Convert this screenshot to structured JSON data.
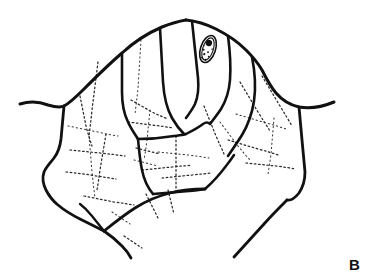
{
  "figure": {
    "panel_label": "B",
    "caption_text": "",
    "background_color": "#ffffff",
    "ink_color": "#111111",
    "width_px": 369,
    "height_px": 278,
    "medium": "black-and-white line drawing"
  },
  "artwork": {
    "spiracle": {
      "label": "spiracle",
      "center_x": 208,
      "center_y": 49,
      "rx": 7.5,
      "ry": 14,
      "rotation_deg": 18,
      "dark_dot": {
        "cx": 207,
        "cy": 43,
        "r": 3.2
      },
      "speckles": [
        [
          204,
          51,
          1.0
        ],
        [
          209,
          52,
          0.9
        ],
        [
          206,
          55,
          1.1
        ],
        [
          211,
          56,
          0.8
        ],
        [
          205,
          59,
          0.9
        ],
        [
          209,
          60,
          1.0
        ],
        [
          203,
          47,
          0.7
        ],
        [
          212,
          48,
          0.7
        ]
      ]
    },
    "outline_paths": [
      {
        "name": "upper-left-margin",
        "width": 3.0,
        "d": "M 20 104 C 30 101 40 102 48 105 C 55 107 60 108 64 106 C 70 103 76 97 84 89 C 95 78 108 65 122 53 C 134 42 148 33 162 27 C 172 23 180 21 186 20"
      },
      {
        "name": "upper-right-margin",
        "width": 3.0,
        "d": "M 186 20 C 196 21 206 24 216 29 C 228 35 238 42 246 50 C 252 56 258 63 262 70 C 266 78 270 86 276 93 C 282 100 290 105 299 107 C 310 109 322 107 334 102"
      },
      {
        "name": "left-lateral-margin",
        "width": 2.8,
        "d": "M 64 106 C 63 117 62 128 61 139 C 60 147 58 153 54 158 C 50 163 46 167 44 172 C 42 178 43 184 46 190 C 49 196 53 201 58 205 C 64 210 72 215 80 219 C 88 223 96 227 104 231"
      },
      {
        "name": "lower-left-apex",
        "width": 2.8,
        "d": "M 104 231 C 110 235 116 240 122 246 C 126 250 129 254 131 258"
      },
      {
        "name": "lower-median-margin",
        "width": 2.8,
        "d": "M 104 231 C 114 223 124 215 135 208 C 146 201 158 196 170 193 C 182 190 194 189 205 189"
      },
      {
        "name": "lower-right-diagonal",
        "width": 2.8,
        "d": "M 234 257 C 244 246 254 235 264 224 C 272 215 280 207 287 200"
      },
      {
        "name": "right-lateral-margin",
        "width": 2.8,
        "d": "M 299 107 C 300 118 301 129 302 140 C 303 151 304 162 305 172 C 305 180 303 187 299 193 C 295 198 291 201 287 200"
      },
      {
        "name": "segment-suture-1",
        "width": 2.6,
        "d": "M 122 53 C 122 66 122 79 122 92 C 122 104 124 114 128 122 C 131 129 135 134 138 139"
      },
      {
        "name": "segment-suture-2",
        "width": 2.6,
        "d": "M 160 28 C 161 46 162 64 163 82 C 164 97 167 109 172 118 C 176 125 180 130 184 134"
      },
      {
        "name": "segment-suture-3",
        "width": 2.6,
        "d": "M 192 21 C 194 40 196 59 198 78 C 199 89 198 97 195 104 C 192 110 189 114 186 118"
      },
      {
        "name": "segment-suture-4",
        "width": 2.6,
        "d": "M 228 36 C 230 51 231 66 230 80 C 229 92 226 101 221 109 C 217 115 213 120 210 124"
      },
      {
        "name": "segment-suture-5",
        "width": 2.6,
        "d": "M 252 57 C 255 72 256 87 254 101 C 252 114 248 125 242 135 C 237 143 232 150 228 156"
      },
      {
        "name": "inner-arc-upper",
        "width": 2.6,
        "d": "M 138 139 C 150 139 162 138 174 136 C 180 135 183 135 186 134"
      },
      {
        "name": "inner-arc-mid",
        "width": 2.4,
        "d": "M 186 134 C 192 131 198 128 203 124 C 206 122 208 122 210 124"
      },
      {
        "name": "central-node-descender",
        "width": 2.6,
        "d": "M 138 139 C 139 150 140 161 142 170 C 144 180 148 188 153 194"
      },
      {
        "name": "lower-median-suture",
        "width": 2.6,
        "d": "M 153 194 C 165 193 177 192 189 191 C 196 190 201 190 205 189"
      },
      {
        "name": "lower-arc-right",
        "width": 2.5,
        "d": "M 205 189 C 213 182 220 174 226 166 C 230 161 232 158 234 155"
      },
      {
        "name": "left-inner-fold",
        "width": 2.3,
        "d": "M 104 231 C 100 226 96 221 92 216 C 88 211 84 207 80 204"
      }
    ],
    "dotted_vein_paths": [
      {
        "name": "vein-left-1",
        "d": "M 98 62 C 96 78 94 94 92 110 C 91 120 90 128 89 136"
      },
      {
        "name": "vein-left-2",
        "d": "M 80 96 C 82 106 84 116 86 126 C 88 134 90 140 92 146"
      },
      {
        "name": "vein-left-3",
        "d": "M 68 126 C 78 128 88 130 98 132 C 106 134 112 135 118 136"
      },
      {
        "name": "vein-left-4",
        "d": "M 70 150 C 80 151 90 152 100 153 C 110 154 118 155 125 156"
      },
      {
        "name": "vein-left-5",
        "d": "M 66 172 C 76 173 86 174 96 176 C 104 177 110 178 116 179"
      },
      {
        "name": "vein-left-6",
        "d": "M 89 136 C 90 148 91 160 92 172 C 93 182 94 190 95 198"
      },
      {
        "name": "vein-left-7",
        "d": "M 106 134 C 104 146 102 158 100 170 C 99 178 98 184 97 190"
      },
      {
        "name": "vein-left-8",
        "d": "M 84 196 C 94 198 104 200 114 202 C 122 203 128 204 134 205"
      },
      {
        "name": "vein-mid-1",
        "d": "M 141 40 C 140 56 139 72 138 88 C 137 98 136 106 135 114"
      },
      {
        "name": "vein-mid-2",
        "d": "M 131 100 C 138 104 145 108 152 112 C 158 115 163 117 168 119"
      },
      {
        "name": "vein-mid-3",
        "d": "M 128 122 C 136 123 144 124 152 125 C 160 126 167 127 173 128"
      },
      {
        "name": "vein-mid-4",
        "d": "M 150 110 C 149 120 148 130 147 140 C 146 148 145 154 144 160"
      },
      {
        "name": "vein-mid-5",
        "d": "M 142 170 C 152 169 162 168 172 167 C 180 166 186 166 192 165"
      },
      {
        "name": "vein-mid-6",
        "d": "M 176 136 C 176 148 176 160 176 172 C 176 180 176 186 176 192"
      },
      {
        "name": "vein-mid-7",
        "d": "M 158 152 C 168 153 178 154 188 155 C 196 156 203 157 209 158"
      },
      {
        "name": "vein-mid-8",
        "d": "M 162 178 C 172 177 182 176 192 175 C 200 174 206 174 211 173"
      },
      {
        "name": "vein-right-1",
        "d": "M 204 106 C 208 116 212 126 216 136 C 219 143 222 149 224 154"
      },
      {
        "name": "vein-right-2",
        "d": "M 220 122 C 226 130 232 138 238 146 C 243 152 247 157 251 161"
      },
      {
        "name": "vein-right-3",
        "d": "M 240 82 C 246 92 252 102 258 112 C 263 120 267 126 270 131"
      },
      {
        "name": "vein-right-4",
        "d": "M 262 76 C 268 86 274 96 280 106 C 285 114 289 121 292 126"
      },
      {
        "name": "vein-right-5",
        "d": "M 236 114 C 246 117 256 120 266 123 C 274 125 280 127 286 129"
      },
      {
        "name": "vein-right-6",
        "d": "M 228 140 C 238 143 248 146 258 149 C 266 151 272 153 278 155"
      },
      {
        "name": "vein-right-7",
        "d": "M 246 163 C 256 164 266 165 276 166 C 284 167 290 168 295 169"
      },
      {
        "name": "vein-right-8",
        "d": "M 274 118 C 273 130 272 142 271 154 C 270 162 269 168 268 174"
      },
      {
        "name": "vein-apex-1",
        "d": "M 146 194 C 150 202 154 210 158 218"
      },
      {
        "name": "vein-apex-2",
        "d": "M 168 190 C 170 198 172 206 174 214"
      },
      {
        "name": "vein-base-1",
        "d": "M 112 212 C 118 216 124 220 130 224"
      },
      {
        "name": "vein-base-2",
        "d": "M 124 236 C 130 240 136 244 142 248"
      },
      {
        "name": "vein-core-1",
        "d": "M 136 148 C 144 150 152 152 160 154"
      },
      {
        "name": "vein-core-2",
        "d": "M 134 160 C 142 162 150 164 158 166"
      }
    ]
  }
}
